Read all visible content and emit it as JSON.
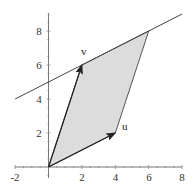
{
  "diagram": {
    "type": "vector-parallelogram",
    "axes": {
      "x": {
        "min": -2,
        "max": 8,
        "ticks": [
          "-2",
          "2",
          "4",
          "6",
          "8"
        ]
      },
      "y": {
        "min": -1,
        "max": 9,
        "ticks": [
          "2",
          "4",
          "6",
          "8"
        ]
      }
    },
    "vectors": [
      {
        "name": "u",
        "label": "u",
        "from": [
          0,
          0
        ],
        "to": [
          4,
          2
        ]
      },
      {
        "name": "v",
        "label": "v",
        "from": [
          0,
          0
        ],
        "to": [
          2,
          6
        ]
      }
    ],
    "parallelogram": {
      "vertices": [
        [
          0,
          0
        ],
        [
          4,
          2
        ],
        [
          6,
          8
        ],
        [
          2,
          6
        ]
      ],
      "fill": "#d9d9d9"
    },
    "line": {
      "equation": "y = 0.5x + 5",
      "from": [
        -2,
        4
      ],
      "to": [
        8,
        9
      ]
    },
    "colors": {
      "axis": "#555555",
      "line": "#444444",
      "vector": "#222222",
      "fill": "#dcdcdc"
    }
  }
}
